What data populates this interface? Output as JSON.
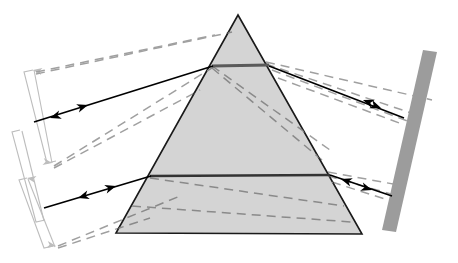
{
  "figure": {
    "width": 458,
    "height": 263,
    "background": "#ffffff"
  },
  "colors": {
    "prism_fill": "#d4d4d4",
    "prism_stroke": "#1a1a1a",
    "ray_solid": "#000000",
    "ray_dashed": "#a0a0a0",
    "ray_dashed_dark": "#8a8a8a",
    "mirror_fill": "#9c9c9c",
    "bracket": "#bdbdbd",
    "internal_band": "#5a5a5a"
  },
  "prism": {
    "name": "triangular-prism",
    "apex": {
      "x": 238,
      "y": 15
    },
    "base_left": {
      "x": 116,
      "y": 233
    },
    "base_right": {
      "x": 362,
      "y": 234
    },
    "fill": "#d4d4d4",
    "stroke": "#1a1a1a",
    "stroke_width": 1.6
  },
  "mirror": {
    "name": "mirror-screen",
    "label": "screen",
    "points": "423,50 437,52 396,232 382,230",
    "fill": "#9c9c9c"
  },
  "internal_bands": [
    {
      "name": "upper-internal-beam",
      "x1": 212,
      "y1": 66,
      "x2": 269,
      "y2": 65,
      "width": 3.2,
      "color": "#5a5a5a"
    },
    {
      "name": "lower-internal-beam",
      "x1": 150,
      "y1": 176,
      "x2": 330,
      "y2": 175,
      "width": 2.4,
      "color": "#333333"
    }
  ],
  "solid_rays": [
    {
      "name": "incident-ray-upper",
      "x1": 34,
      "y1": 122,
      "x2": 213,
      "y2": 66
    },
    {
      "name": "incident-ray-lower",
      "x1": 44,
      "y1": 208,
      "x2": 151,
      "y2": 176
    },
    {
      "name": "exit-ray-upper",
      "x1": 269,
      "y1": 66,
      "x2": 404,
      "y2": 118
    },
    {
      "name": "exit-ray-lower",
      "x1": 330,
      "y1": 175,
      "x2": 392,
      "y2": 196
    }
  ],
  "arrowheads": [
    {
      "name": "arrowhead-incident-upper-forward",
      "x": 88,
      "y": 105,
      "angle": 342,
      "color": "#000000"
    },
    {
      "name": "arrowhead-incident-upper-reverse",
      "x": 50,
      "y": 118,
      "angle": 162,
      "color": "#000000"
    },
    {
      "name": "arrowhead-incident-lower-forward",
      "x": 116,
      "y": 186,
      "angle": 343,
      "color": "#000000"
    },
    {
      "name": "arrowhead-incident-lower-reverse",
      "x": 78,
      "y": 198,
      "angle": 163,
      "color": "#000000"
    },
    {
      "name": "arrowhead-exit-upper-reverse",
      "x": 363,
      "y": 100,
      "angle": 201,
      "color": "#000000"
    },
    {
      "name": "arrowhead-exit-upper-forward",
      "x": 381,
      "y": 108,
      "angle": 21,
      "color": "#000000"
    },
    {
      "name": "arrowhead-exit-lower-reverse",
      "x": 341,
      "y": 179,
      "angle": 198,
      "color": "#000000"
    },
    {
      "name": "arrowhead-exit-lower-forward",
      "x": 372,
      "y": 190,
      "angle": 18,
      "color": "#000000"
    }
  ],
  "dashed_rays": [
    {
      "name": "dashed-ray-top-incoming",
      "x1": 36,
      "y1": 72,
      "x2": 215,
      "y2": 35
    },
    {
      "name": "dashed-ray-top-incoming-b",
      "x1": 36,
      "y1": 74,
      "x2": 232,
      "y2": 32
    },
    {
      "name": "dashed-ray-mid-incoming",
      "x1": 54,
      "y1": 166,
      "x2": 215,
      "y2": 66
    },
    {
      "name": "dashed-ray-mid-incoming-b",
      "x1": 54,
      "y1": 168,
      "x2": 200,
      "y2": 90
    },
    {
      "name": "dashed-ray-low-incoming",
      "x1": 58,
      "y1": 246,
      "x2": 180,
      "y2": 196
    },
    {
      "name": "dashed-ray-low-incoming-b",
      "x1": 58,
      "y1": 248,
      "x2": 150,
      "y2": 218
    },
    {
      "name": "dashed-internal-upper",
      "x1": 212,
      "y1": 66,
      "x2": 330,
      "y2": 150
    },
    {
      "name": "dashed-internal-upper-b",
      "x1": 212,
      "y1": 68,
      "x2": 322,
      "y2": 160
    },
    {
      "name": "dashed-internal-lower",
      "x1": 150,
      "y1": 178,
      "x2": 344,
      "y2": 206
    },
    {
      "name": "dashed-internal-lower-b",
      "x1": 132,
      "y1": 206,
      "x2": 352,
      "y2": 222
    },
    {
      "name": "dashed-exit-upper-1",
      "x1": 266,
      "y1": 62,
      "x2": 432,
      "y2": 100
    },
    {
      "name": "dashed-exit-upper-2",
      "x1": 266,
      "y1": 64,
      "x2": 420,
      "y2": 116
    },
    {
      "name": "dashed-exit-upper-3",
      "x1": 272,
      "y1": 70,
      "x2": 410,
      "y2": 122
    },
    {
      "name": "dashed-exit-upper-4",
      "x1": 278,
      "y1": 78,
      "x2": 402,
      "y2": 124
    },
    {
      "name": "dashed-exit-lower-1",
      "x1": 328,
      "y1": 172,
      "x2": 404,
      "y2": 186
    },
    {
      "name": "dashed-exit-lower-2",
      "x1": 328,
      "y1": 176,
      "x2": 398,
      "y2": 196
    },
    {
      "name": "dashed-exit-lower-3",
      "x1": 332,
      "y1": 182,
      "x2": 394,
      "y2": 202
    }
  ],
  "brackets": [
    {
      "name": "bracket-upper",
      "color": "#bdbdbd",
      "segments": [
        {
          "x1": 23,
          "y1": 70,
          "x2": 50,
          "y2": 162
        },
        {
          "x1": 18,
          "y1": 130,
          "x2": 45,
          "y2": 220
        }
      ],
      "arrow_tips": [
        {
          "name": "bracket-upper-tip-top",
          "x": 33,
          "y": 70,
          "angle": 190
        },
        {
          "name": "bracket-upper-tip-bottom",
          "x": 52,
          "y": 163,
          "angle": 10
        }
      ]
    },
    {
      "name": "bracket-lower",
      "color": "#bdbdbd",
      "arrow_tips": [
        {
          "name": "bracket-lower-tip-top",
          "x": 27,
          "y": 178,
          "angle": 190
        },
        {
          "name": "bracket-lower-tip-bottom",
          "x": 56,
          "y": 246,
          "angle": 10
        }
      ]
    }
  ],
  "chart_data": {
    "type": "diagram",
    "elements": [
      "prism",
      "incident-rays",
      "dispersed-rays",
      "mirror-screen",
      "measurement-brackets"
    ]
  }
}
